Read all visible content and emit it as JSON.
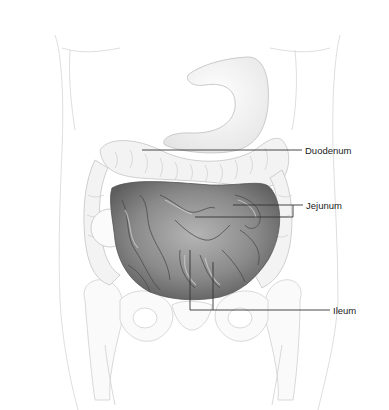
{
  "figure": {
    "labels": [
      {
        "id": "duodenum",
        "text": "Duodenum",
        "x": 305,
        "y": 146
      },
      {
        "id": "jejunum",
        "text": "Jejunum",
        "x": 306,
        "y": 202
      },
      {
        "id": "ileum",
        "text": "Ileum",
        "x": 333,
        "y": 306
      }
    ],
    "colors": {
      "background": "#ffffff",
      "outline": "#c8c8c8",
      "intestine_fill": "#8a8a8a",
      "colon_fill": "#f2f2f2",
      "leader_line": "#333333",
      "label_text": "#1a1a1a"
    }
  }
}
